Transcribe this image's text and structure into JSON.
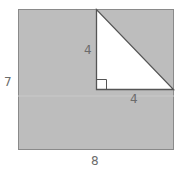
{
  "figure": {
    "type": "geometry-diagram",
    "shapes": {
      "rectangle": {
        "width_label": "8",
        "height_label": "7",
        "fill": "#bdbdbd"
      },
      "triangle": {
        "leg_vertical_label": "4",
        "leg_horizontal_label": "4",
        "fill": "#ffffff",
        "right_angle_marker": true
      }
    },
    "labels": {
      "rect_height": "7",
      "rect_width": "8",
      "tri_vertical": "4",
      "tri_horizontal": "4"
    },
    "colors": {
      "shaded": "#bdbdbd",
      "stroke": "#7a7a7a",
      "text": "#6b6b6b"
    }
  }
}
